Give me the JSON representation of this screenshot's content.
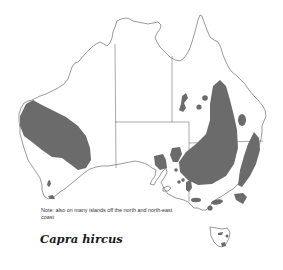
{
  "map": {
    "title": "Capra hircus",
    "region": "Australia",
    "note": "Note: also on many islands off the north and north-east coast",
    "colors": {
      "range_fill": "#6b6b6b",
      "coastline": "#555555",
      "background": "#ffffff"
    },
    "legend": {
      "shaded_area": "distribution range"
    }
  }
}
